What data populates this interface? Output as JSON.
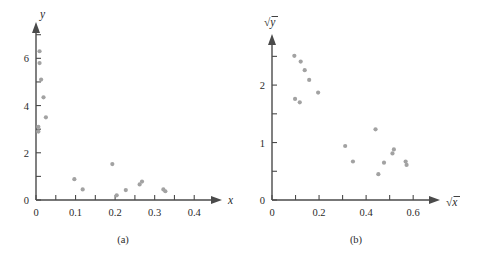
{
  "figure": {
    "panels": [
      {
        "caption": "(a)",
        "xlabel": "x",
        "ylabel": "y"
      },
      {
        "caption": "(b)",
        "xlabel": "√x",
        "ylabel": "√y"
      }
    ]
  },
  "chart_data": [
    {
      "type": "scatter",
      "title": "(a)",
      "xlabel": "x",
      "ylabel": "y",
      "xlim": [
        0,
        0.45
      ],
      "ylim": [
        0,
        7.2
      ],
      "xticks": [
        0,
        0.05,
        0.1,
        0.15,
        0.2,
        0.25,
        0.3,
        0.35,
        0.4
      ],
      "xticklabels": [
        "0",
        "",
        "0.1",
        "",
        "0.2",
        "",
        "0.3",
        "",
        "0.4"
      ],
      "yticks": [
        0,
        1,
        2,
        3,
        4,
        5,
        6,
        7
      ],
      "yticklabels": [
        "0",
        "",
        "2",
        "",
        "4",
        "",
        "6",
        ""
      ],
      "grid": false,
      "legend": false,
      "marker_color": "#a2a2a2",
      "points": [
        {
          "x": 0.009,
          "y": 6.3
        },
        {
          "x": 0.009,
          "y": 5.8
        },
        {
          "x": 0.013,
          "y": 5.1
        },
        {
          "x": 0.019,
          "y": 4.35
        },
        {
          "x": 0.025,
          "y": 3.5
        },
        {
          "x": 0.006,
          "y": 3.1
        },
        {
          "x": 0.006,
          "y": 2.9
        },
        {
          "x": 0.097,
          "y": 0.88
        },
        {
          "x": 0.118,
          "y": 0.45
        },
        {
          "x": 0.193,
          "y": 1.52
        },
        {
          "x": 0.204,
          "y": 0.2
        },
        {
          "x": 0.227,
          "y": 0.42
        },
        {
          "x": 0.262,
          "y": 0.66
        },
        {
          "x": 0.268,
          "y": 0.78
        },
        {
          "x": 0.322,
          "y": 0.45
        },
        {
          "x": 0.327,
          "y": 0.37
        }
      ]
    },
    {
      "type": "scatter",
      "title": "(b)",
      "xlabel": "√x",
      "ylabel": "√y",
      "xlim": [
        0,
        0.68
      ],
      "ylim": [
        0,
        2.75
      ],
      "xticks": [
        0,
        0.1,
        0.2,
        0.3,
        0.4,
        0.5,
        0.6
      ],
      "xticklabels": [
        "0",
        "",
        "0.2",
        "",
        "0.4",
        "",
        "0.6"
      ],
      "yticks": [
        0,
        0.5,
        1,
        1.5,
        2,
        2.5
      ],
      "yticklabels": [
        "0",
        "",
        "1",
        "",
        "2",
        ""
      ],
      "grid": false,
      "legend": false,
      "marker_color": "#a2a2a2",
      "points": [
        {
          "x": 0.095,
          "y": 2.51
        },
        {
          "x": 0.122,
          "y": 2.41
        },
        {
          "x": 0.139,
          "y": 2.26
        },
        {
          "x": 0.158,
          "y": 2.09
        },
        {
          "x": 0.196,
          "y": 1.87
        },
        {
          "x": 0.098,
          "y": 1.76
        },
        {
          "x": 0.118,
          "y": 1.7
        },
        {
          "x": 0.311,
          "y": 0.94
        },
        {
          "x": 0.344,
          "y": 0.67
        },
        {
          "x": 0.44,
          "y": 1.23
        },
        {
          "x": 0.452,
          "y": 0.45
        },
        {
          "x": 0.476,
          "y": 0.65
        },
        {
          "x": 0.512,
          "y": 0.81
        },
        {
          "x": 0.518,
          "y": 0.88
        },
        {
          "x": 0.568,
          "y": 0.67
        },
        {
          "x": 0.572,
          "y": 0.61
        }
      ]
    }
  ]
}
